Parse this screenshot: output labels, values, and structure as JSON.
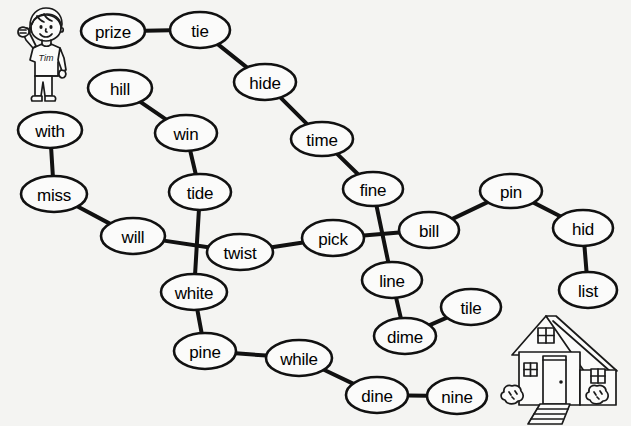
{
  "page": {
    "background_color": "#f4f4f2",
    "ink_color": "#111111",
    "width": 631,
    "height": 426
  },
  "graph": {
    "nodes": [
      {
        "id": "prize",
        "label": "prize",
        "cx": 113,
        "cy": 31,
        "rx": 32,
        "ry": 17
      },
      {
        "id": "tie",
        "label": "tie",
        "cx": 200,
        "cy": 30,
        "rx": 30,
        "ry": 18
      },
      {
        "id": "hide",
        "label": "hide",
        "cx": 265,
        "cy": 82,
        "rx": 31,
        "ry": 18
      },
      {
        "id": "hill",
        "label": "hill",
        "cx": 120,
        "cy": 88,
        "rx": 32,
        "ry": 18
      },
      {
        "id": "time",
        "label": "time",
        "cx": 322,
        "cy": 139,
        "rx": 31,
        "ry": 17
      },
      {
        "id": "with",
        "label": "with",
        "cx": 50,
        "cy": 130,
        "rx": 32,
        "ry": 18
      },
      {
        "id": "win",
        "label": "win",
        "cx": 186,
        "cy": 133,
        "rx": 31,
        "ry": 18
      },
      {
        "id": "fine",
        "label": "fine",
        "cx": 373,
        "cy": 189,
        "rx": 30,
        "ry": 17
      },
      {
        "id": "pin",
        "label": "pin",
        "cx": 511,
        "cy": 191,
        "rx": 31,
        "ry": 17
      },
      {
        "id": "miss",
        "label": "miss",
        "cx": 54,
        "cy": 194,
        "rx": 33,
        "ry": 18
      },
      {
        "id": "tide",
        "label": "tide",
        "cx": 200,
        "cy": 192,
        "rx": 31,
        "ry": 18
      },
      {
        "id": "bill",
        "label": "bill",
        "cx": 429,
        "cy": 230,
        "rx": 30,
        "ry": 18
      },
      {
        "id": "hid",
        "label": "hid",
        "cx": 583,
        "cy": 228,
        "rx": 30,
        "ry": 18
      },
      {
        "id": "will",
        "label": "will",
        "cx": 133,
        "cy": 236,
        "rx": 32,
        "ry": 18
      },
      {
        "id": "twist",
        "label": "twist",
        "cx": 240,
        "cy": 252,
        "rx": 33,
        "ry": 18
      },
      {
        "id": "pick",
        "label": "pick",
        "cx": 333,
        "cy": 238,
        "rx": 31,
        "ry": 18
      },
      {
        "id": "line",
        "label": "line",
        "cx": 392,
        "cy": 280,
        "rx": 30,
        "ry": 18
      },
      {
        "id": "list",
        "label": "list",
        "cx": 588,
        "cy": 290,
        "rx": 29,
        "ry": 18
      },
      {
        "id": "white",
        "label": "white",
        "cx": 194,
        "cy": 292,
        "rx": 33,
        "ry": 18
      },
      {
        "id": "tile",
        "label": "tile",
        "cx": 471,
        "cy": 307,
        "rx": 30,
        "ry": 18
      },
      {
        "id": "dime",
        "label": "dime",
        "cx": 405,
        "cy": 336,
        "rx": 31,
        "ry": 18
      },
      {
        "id": "pine",
        "label": "pine",
        "cx": 205,
        "cy": 351,
        "rx": 31,
        "ry": 18
      },
      {
        "id": "while",
        "label": "while",
        "cx": 299,
        "cy": 358,
        "rx": 33,
        "ry": 18
      },
      {
        "id": "dine",
        "label": "dine",
        "cx": 377,
        "cy": 395,
        "rx": 31,
        "ry": 18
      },
      {
        "id": "nine",
        "label": "nine",
        "cx": 457,
        "cy": 396,
        "rx": 30,
        "ry": 18
      }
    ],
    "edges": [
      {
        "from": "prize",
        "to": "tie"
      },
      {
        "from": "tie",
        "to": "hide"
      },
      {
        "from": "hide",
        "to": "time"
      },
      {
        "from": "time",
        "to": "fine"
      },
      {
        "from": "hill",
        "to": "win"
      },
      {
        "from": "win",
        "to": "tide"
      },
      {
        "from": "with",
        "to": "miss"
      },
      {
        "from": "miss",
        "to": "will"
      },
      {
        "from": "will",
        "to": "twist"
      },
      {
        "from": "tide",
        "to": "white"
      },
      {
        "from": "twist",
        "to": "pick"
      },
      {
        "from": "pick",
        "to": "bill"
      },
      {
        "from": "fine",
        "to": "line"
      },
      {
        "from": "bill",
        "to": "pin"
      },
      {
        "from": "pin",
        "to": "hid"
      },
      {
        "from": "hid",
        "to": "list"
      },
      {
        "from": "line",
        "to": "dime"
      },
      {
        "from": "dime",
        "to": "tile"
      },
      {
        "from": "white",
        "to": "pine"
      },
      {
        "from": "pine",
        "to": "while"
      },
      {
        "from": "while",
        "to": "dine"
      },
      {
        "from": "dine",
        "to": "nine"
      }
    ]
  },
  "illustrations": {
    "boy": {
      "name": "boy-waving",
      "shirt_text": "Tim"
    },
    "house": {
      "name": "house"
    }
  }
}
